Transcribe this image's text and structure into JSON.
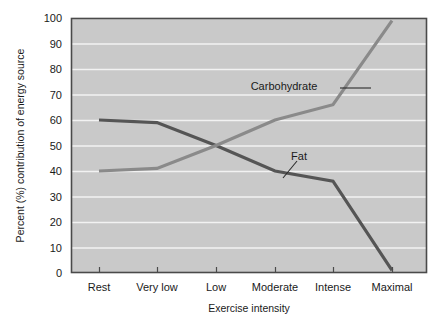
{
  "chart_data": {
    "type": "line",
    "title": "",
    "xlabel": "Exercise intensity",
    "ylabel": "Percent (%) contribution of energy source",
    "categories": [
      "Rest",
      "Very low",
      "Low",
      "Moderate",
      "Intense",
      "Maximal"
    ],
    "ylim": [
      0,
      100
    ],
    "yticks": [
      0,
      10,
      20,
      30,
      40,
      50,
      60,
      70,
      80,
      90,
      100
    ],
    "ytick_labels": [
      "0",
      "10",
      "20",
      "30",
      "40",
      "50",
      "60",
      "70",
      "80",
      "90",
      "100"
    ],
    "grid": true,
    "grid_axis": "y",
    "legend": "inline-annotations",
    "series": [
      {
        "name": "Fat",
        "color": "#555555",
        "values": [
          60,
          59,
          50,
          40,
          36,
          1
        ]
      },
      {
        "name": "Carbohydrate",
        "color": "#8a8a8a",
        "values": [
          40,
          41,
          50,
          60,
          66,
          99
        ]
      }
    ],
    "annotations": [
      {
        "text": "Carbohydrate",
        "series": "Carbohydrate",
        "label_x": 284,
        "label_y": 90,
        "leader_from_x": 340,
        "leader_to_x": 371,
        "leader_y": 88
      },
      {
        "text": "Fat",
        "series": "Fat",
        "label_x": 299,
        "label_y": 160,
        "leader_from_x": 297,
        "leader_to_x": 283,
        "leader_y": 164
      }
    ],
    "colors": {
      "plot_background": "#c9c9c9",
      "gridline": "#f2f2f2",
      "frame": "#4a4a4a",
      "page_background": "#ffffff",
      "text": "#1a1a1a",
      "fat_line": "#555555",
      "carbohydrate_line": "#8a8a8a"
    },
    "geometry": {
      "plot_left": 71,
      "plot_right": 427,
      "plot_top": 18,
      "plot_bottom": 273,
      "tick_x": [
        99,
        157,
        216,
        275,
        333,
        392
      ]
    }
  }
}
